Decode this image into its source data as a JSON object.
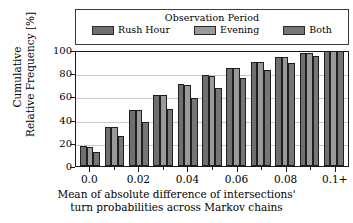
{
  "chart_data": {
    "type": "bar",
    "title": "",
    "xlabel": "Mean of absolute difference of intersections' turn probabilities across Markov chains",
    "xlabel_line1": "Mean of absolute difference of intersections'",
    "xlabel_line2": "turn probabilities across Markov chains",
    "ylabel": "Cumulative Relative Frequency [%]",
    "ylabel_line1": "Cumulative",
    "ylabel_line2": "Relative Frequency [%]",
    "ylim": [
      0,
      100
    ],
    "yticks": [
      100,
      80,
      60,
      40,
      20,
      0
    ],
    "ytick_labels": [
      "100",
      "80",
      "60",
      "40",
      "20",
      "0"
    ],
    "xticks": [
      0.0,
      0.02,
      0.04,
      0.06,
      0.08,
      0.1
    ],
    "xtick_labels": [
      "0.0",
      "0.02",
      "0.04",
      "0.06",
      "0.08",
      "0.1+"
    ],
    "categories": [
      "0.0",
      "0.01",
      "0.02",
      "0.03",
      "0.04",
      "0.05",
      "0.06",
      "0.07",
      "0.08",
      "0.09",
      "0.1+"
    ],
    "grid": true,
    "legend_position": "above-axes",
    "legend_title": "Observation Period",
    "series": [
      {
        "name": "Rush Hour",
        "color": "#6f6f6f",
        "values": [
          17.5,
          34.0,
          48.5,
          61.0,
          70.5,
          78.5,
          84.5,
          90.0,
          94.0,
          97.5,
          100.0
        ]
      },
      {
        "name": "Evening",
        "color": "#9a9a9a",
        "values": [
          16.5,
          33.5,
          48.5,
          61.0,
          70.0,
          78.0,
          84.5,
          90.0,
          94.0,
          97.5,
          100.0
        ]
      },
      {
        "name": "Both",
        "color": "#767676",
        "values": [
          12.5,
          26.0,
          38.0,
          49.0,
          59.0,
          67.5,
          76.0,
          83.0,
          89.0,
          95.0,
          100.0
        ]
      }
    ]
  },
  "legend": {
    "title": "Observation Period",
    "entries": [
      {
        "label": "Rush Hour"
      },
      {
        "label": "Evening"
      },
      {
        "label": "Both"
      }
    ]
  },
  "axes": {
    "ylabel_line1": "Cumulative",
    "ylabel_line2": "Relative Frequency [%]",
    "xlabel_line1": "Mean of absolute difference of intersections'",
    "xlabel_line2": "turn probabilities across Markov chains",
    "ytick_labels": [
      "100",
      "80",
      "60",
      "40",
      "20",
      "0"
    ],
    "xtick_labels": [
      "0.0",
      "0.02",
      "0.04",
      "0.06",
      "0.08",
      "0.1+"
    ]
  }
}
